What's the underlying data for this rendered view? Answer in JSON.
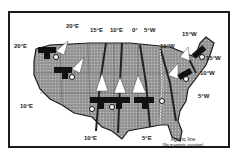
{
  "colors": {
    "land": "#9a9a9a",
    "land_pattern": "#b4b4b4",
    "coast": "#1a1a1a",
    "frame": "#1a1a1a",
    "background": "#ffffff",
    "arrow": "#ffffff",
    "icon": "#111111"
  },
  "labels": {
    "west_20e": "20°E",
    "nw_20e": "20°E",
    "sw_10e": "10°E",
    "south_10e": "10°E",
    "top_15e": "15°E",
    "top_10e": "10°E",
    "top_0": "0°",
    "top_5w": "5°W",
    "ne_15w": "15°W",
    "ne_10w_a": "10°W",
    "east_15w": "15°W",
    "east_10w": "10°W",
    "east_5w": "5°W",
    "south_5e": "5°E"
  },
  "agonic": {
    "line1": "Agonic line",
    "line2": "(No magnetic variation)"
  },
  "icons": [
    {
      "name": "airplane-compass-icon",
      "region": "northwest"
    },
    {
      "name": "airplane-compass-icon",
      "region": "west"
    },
    {
      "name": "airplane-compass-icon",
      "region": "southwest"
    },
    {
      "name": "airplane-compass-icon",
      "region": "south-central"
    },
    {
      "name": "airplane-compass-icon",
      "region": "southeast"
    },
    {
      "name": "airplane-compass-icon",
      "region": "east"
    },
    {
      "name": "airplane-compass-icon",
      "region": "northeast"
    }
  ]
}
